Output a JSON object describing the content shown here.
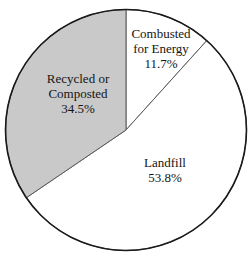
{
  "chart_data": {
    "type": "pie",
    "title": "",
    "subtitle": "",
    "xlabel": "",
    "ylabel": "",
    "legend_position": "none",
    "grid": false,
    "unit": "%",
    "start_angle_deg": 0,
    "direction": "clockwise",
    "categories": [
      "Combusted for Energy",
      "Landfill",
      "Recycled or Composted"
    ],
    "values": [
      11.7,
      53.8,
      34.5
    ],
    "slices": [
      {
        "label": "Combusted for Energy",
        "label_line1": "Combusted",
        "label_line2": "for Energy",
        "value": 11.7,
        "value_text": "11.7%",
        "color": "#ffffff",
        "start_angle_deg": 0.0,
        "end_angle_deg": 42.1
      },
      {
        "label": "Landfill",
        "label_line1": "Landfill",
        "label_line2": "",
        "value": 53.8,
        "value_text": "53.8%",
        "color": "#ffffff",
        "start_angle_deg": 42.1,
        "end_angle_deg": 235.8
      },
      {
        "label": "Recycled or Composted",
        "label_line1": "Recycled or",
        "label_line2": "Composted",
        "value": 34.5,
        "value_text": "34.5%",
        "color": "#c9c9c9",
        "start_angle_deg": 235.8,
        "end_angle_deg": 360.0
      }
    ]
  },
  "style": {
    "background": "#ffffff",
    "outline_color": "#1a1a1a",
    "divider_color": "#5a5a5a",
    "text_color": "#141414",
    "gray_fill": "#c9c9c9",
    "white_fill": "#ffffff"
  },
  "geometry": {
    "center_x": 126,
    "center_y": 130,
    "radius": 120.5
  }
}
